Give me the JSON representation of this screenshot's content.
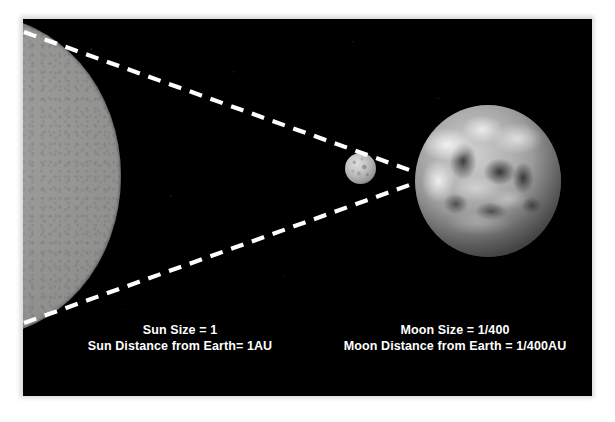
{
  "figure": {
    "frame_color": "#ffffff",
    "sky_color": "#000000",
    "line_color": "#ffffff",
    "caption_color": "#ffffff"
  },
  "bodies": [
    {
      "name": "sun",
      "label": "Sun",
      "tone": "#8f8f8d",
      "relative_size": "1",
      "relative_distance": "1AU"
    },
    {
      "name": "moon",
      "label": "Moon",
      "tone": "#b0b0b0",
      "relative_size": "1/400",
      "relative_distance": "1/400AU"
    },
    {
      "name": "earth",
      "label": "Earth",
      "tone": "#888888"
    }
  ],
  "captions": {
    "sun": {
      "line1": "Sun Size = 1",
      "line2": "Sun Distance from Earth= 1AU"
    },
    "moon": {
      "line1": "Moon Size = 1/400",
      "line2": "Moon Distance from Earth = 1/400AU"
    }
  },
  "sightlines": {
    "upper": "M 1,13 L 392,153",
    "lower": "M 1,304 L 392,164",
    "style": "dashed-white",
    "convergence_label": "Earth left limb"
  }
}
